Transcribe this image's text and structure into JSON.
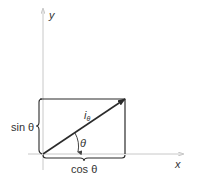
{
  "diagram": {
    "axes": {
      "x_label": "x",
      "y_label": "y"
    },
    "vector": {
      "label_main": "i",
      "label_sub": "θ"
    },
    "angle_label": "θ",
    "sin_label": "sin θ",
    "cos_label": "cos θ",
    "colors": {
      "axis": "#c8c8c8",
      "line": "#2b2b2b",
      "text": "#333333",
      "background": "#ffffff"
    }
  }
}
